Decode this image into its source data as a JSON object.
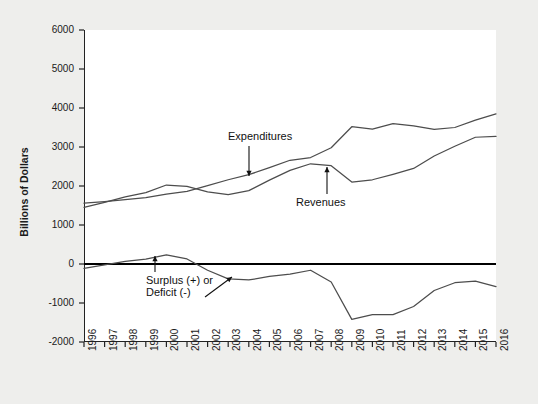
{
  "chart_data": {
    "type": "line",
    "title": "",
    "xlabel": "",
    "ylabel": "Billions of Dollars",
    "xlim": [
      1996,
      2016
    ],
    "ylim": [
      -2000,
      6000
    ],
    "grid": false,
    "legend_position": "inline-annotations",
    "x": [
      1996,
      1997,
      1998,
      1999,
      2000,
      2001,
      2002,
      2003,
      2004,
      2005,
      2006,
      2007,
      2008,
      2009,
      2010,
      2011,
      2012,
      2013,
      2014,
      2015,
      2016
    ],
    "yticks": [
      -2000,
      -1000,
      0,
      1000,
      2000,
      3000,
      4000,
      5000,
      6000
    ],
    "ytick_labels": [
      "-2000",
      "-1000",
      "0",
      "1000",
      "2000",
      "3000",
      "4000",
      "5000",
      "6000"
    ],
    "xtick_labels": [
      "1996",
      "1997",
      "1998",
      "1999",
      "2000",
      "2001",
      "2002",
      "2003",
      "2004",
      "2005",
      "2006",
      "2007",
      "2008",
      "2009",
      "2010",
      "2011",
      "2012",
      "2013",
      "2014",
      "2015",
      "2016"
    ],
    "series": [
      {
        "name": "Expenditures",
        "color": "#4d4d4d",
        "values": [
          1560,
          1600,
          1650,
          1700,
          1790,
          1860,
          2010,
          2160,
          2290,
          2470,
          2660,
          2730,
          2980,
          3520,
          3460,
          3600,
          3540,
          3450,
          3500,
          3690,
          3850
        ]
      },
      {
        "name": "Revenues",
        "color": "#4d4d4d",
        "values": [
          1450,
          1580,
          1720,
          1830,
          2025,
          1990,
          1850,
          1780,
          1880,
          2150,
          2400,
          2570,
          2520,
          2100,
          2160,
          2300,
          2450,
          2770,
          3020,
          3250,
          3270
        ]
      },
      {
        "name": "Surplus (+) or Deficit (-)",
        "color": "#4d4d4d",
        "values": [
          -110,
          -22,
          70,
          125,
          235,
          130,
          -160,
          -380,
          -410,
          -320,
          -260,
          -160,
          -460,
          -1420,
          -1300,
          -1300,
          -1090,
          -680,
          -480,
          -440,
          -580
        ]
      }
    ],
    "annotations": [
      {
        "name": "expenditures-label",
        "text": "Expenditures",
        "arrow": "down"
      },
      {
        "name": "revenues-label",
        "text": "Revenues",
        "arrow": "up"
      },
      {
        "name": "surplus-deficit-label-line1",
        "text": "Surplus (+) or",
        "arrow": "up"
      },
      {
        "name": "surplus-deficit-label-line2",
        "text": "Deficit (-)",
        "arrow": "diagonal-up-right"
      }
    ],
    "zero_line": {
      "value": 0,
      "color": "#000000",
      "width": 2.2
    },
    "axis_color": "#222222",
    "plot_background": "#ffffff",
    "figure_background": "#eeeeec"
  }
}
